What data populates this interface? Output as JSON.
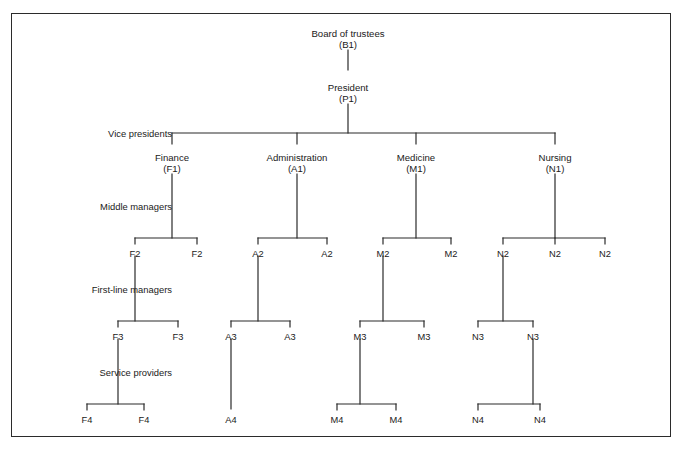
{
  "figure": {
    "kind": "organizational-chart",
    "border_color": "#2b2b2b",
    "line_color": "#2b2b2b",
    "text_color": "#1a1a1a",
    "background": "#ffffff"
  },
  "tier_labels": [
    {
      "id": "vice-presidents",
      "text": "Vice presidents",
      "x": 172,
      "y": 133
    },
    {
      "id": "middle-managers",
      "text": "Middle managers",
      "x": 172,
      "y": 206
    },
    {
      "id": "first-line-managers",
      "text": "First-line managers",
      "x": 172,
      "y": 289
    },
    {
      "id": "service-providers",
      "text": "Service providers",
      "x": 172,
      "y": 372
    }
  ],
  "nodes": [
    {
      "id": "board",
      "title": "Board of trustees",
      "code": "(B1)",
      "x": 348,
      "y": 28
    },
    {
      "id": "president",
      "title": "President",
      "code": "(P1)",
      "x": 348,
      "y": 82
    },
    {
      "id": "vp-finance",
      "title": "Finance",
      "code": "(F1)",
      "x": 172,
      "y": 152
    },
    {
      "id": "vp-administration",
      "title": "Administration",
      "code": "(A1)",
      "x": 297,
      "y": 152
    },
    {
      "id": "vp-medicine",
      "title": "Medicine",
      "code": "(M1)",
      "x": 416,
      "y": 152
    },
    {
      "id": "vp-nursing",
      "title": "Nursing",
      "code": "(N1)",
      "x": 555,
      "y": 152
    },
    {
      "id": "f2-a",
      "title": "",
      "code": "F2",
      "x": 135,
      "y": 249
    },
    {
      "id": "f2-b",
      "title": "",
      "code": "F2",
      "x": 197,
      "y": 249
    },
    {
      "id": "a2-a",
      "title": "",
      "code": "A2",
      "x": 258,
      "y": 249
    },
    {
      "id": "a2-b",
      "title": "",
      "code": "A2",
      "x": 327,
      "y": 249
    },
    {
      "id": "m2-a",
      "title": "",
      "code": "M2",
      "x": 383,
      "y": 249
    },
    {
      "id": "m2-b",
      "title": "",
      "code": "M2",
      "x": 451,
      "y": 249
    },
    {
      "id": "n2-a",
      "title": "",
      "code": "N2",
      "x": 503,
      "y": 249
    },
    {
      "id": "n2-b",
      "title": "",
      "code": "N2",
      "x": 555,
      "y": 249
    },
    {
      "id": "n2-c",
      "title": "",
      "code": "N2",
      "x": 605,
      "y": 249
    },
    {
      "id": "f3-a",
      "title": "",
      "code": "F3",
      "x": 118,
      "y": 332
    },
    {
      "id": "f3-b",
      "title": "",
      "code": "F3",
      "x": 178,
      "y": 332
    },
    {
      "id": "a3-a",
      "title": "",
      "code": "A3",
      "x": 231,
      "y": 332
    },
    {
      "id": "a3-b",
      "title": "",
      "code": "A3",
      "x": 290,
      "y": 332
    },
    {
      "id": "m3-a",
      "title": "",
      "code": "M3",
      "x": 360,
      "y": 332
    },
    {
      "id": "m3-b",
      "title": "",
      "code": "M3",
      "x": 424,
      "y": 332
    },
    {
      "id": "n3-a",
      "title": "",
      "code": "N3",
      "x": 478,
      "y": 332
    },
    {
      "id": "n3-b",
      "title": "",
      "code": "N3",
      "x": 533,
      "y": 332
    },
    {
      "id": "f4-a",
      "title": "",
      "code": "F4",
      "x": 87,
      "y": 415
    },
    {
      "id": "f4-b",
      "title": "",
      "code": "F4",
      "x": 144,
      "y": 415
    },
    {
      "id": "a4-a",
      "title": "",
      "code": "A4",
      "x": 231,
      "y": 415
    },
    {
      "id": "m4-a",
      "title": "",
      "code": "M4",
      "x": 337,
      "y": 415
    },
    {
      "id": "m4-b",
      "title": "",
      "code": "M4",
      "x": 396,
      "y": 415
    },
    {
      "id": "n4-a",
      "title": "",
      "code": "N4",
      "x": 478,
      "y": 415
    },
    {
      "id": "n4-b",
      "title": "",
      "code": "N4",
      "x": 540,
      "y": 415
    }
  ],
  "connectors": {
    "verticals": [
      {
        "id": "board-to-president",
        "x": 348,
        "y1": 50,
        "y2": 70
      },
      {
        "id": "president-to-bus",
        "x": 348,
        "y1": 104,
        "y2": 133
      },
      {
        "id": "drop-finance",
        "x": 172,
        "y1": 133,
        "y2": 144
      },
      {
        "id": "drop-administration",
        "x": 297,
        "y1": 133,
        "y2": 144
      },
      {
        "id": "drop-medicine",
        "x": 416,
        "y1": 133,
        "y2": 144
      },
      {
        "id": "drop-nursing",
        "x": 555,
        "y1": 133,
        "y2": 144
      },
      {
        "id": "f1-stem",
        "x": 172,
        "y1": 174,
        "y2": 238
      },
      {
        "id": "a1-stem",
        "x": 297,
        "y1": 174,
        "y2": 238
      },
      {
        "id": "m1-stem",
        "x": 416,
        "y1": 174,
        "y2": 238
      },
      {
        "id": "n1-stem",
        "x": 555,
        "y1": 174,
        "y2": 238
      },
      {
        "id": "f2a-tick",
        "x": 135,
        "y1": 238,
        "y2": 244
      },
      {
        "id": "f2b-tick",
        "x": 197,
        "y1": 238,
        "y2": 244
      },
      {
        "id": "a2a-tick",
        "x": 258,
        "y1": 238,
        "y2": 244
      },
      {
        "id": "a2b-tick",
        "x": 327,
        "y1": 238,
        "y2": 244
      },
      {
        "id": "m2a-tick",
        "x": 383,
        "y1": 238,
        "y2": 244
      },
      {
        "id": "m2b-tick",
        "x": 451,
        "y1": 238,
        "y2": 244
      },
      {
        "id": "n2a-tick",
        "x": 503,
        "y1": 238,
        "y2": 244
      },
      {
        "id": "n2b-tick",
        "x": 555,
        "y1": 238,
        "y2": 244
      },
      {
        "id": "n2c-tick",
        "x": 605,
        "y1": 238,
        "y2": 244
      },
      {
        "id": "f2a-stem",
        "x": 135,
        "y1": 256,
        "y2": 321
      },
      {
        "id": "a2a-stem",
        "x": 258,
        "y1": 256,
        "y2": 321
      },
      {
        "id": "m2a-stem",
        "x": 383,
        "y1": 256,
        "y2": 321
      },
      {
        "id": "n2a-stem",
        "x": 503,
        "y1": 256,
        "y2": 321
      },
      {
        "id": "f3a-tick",
        "x": 118,
        "y1": 321,
        "y2": 327
      },
      {
        "id": "f3b-tick",
        "x": 178,
        "y1": 321,
        "y2": 327
      },
      {
        "id": "a3a-tick",
        "x": 231,
        "y1": 321,
        "y2": 327
      },
      {
        "id": "a3b-tick",
        "x": 290,
        "y1": 321,
        "y2": 327
      },
      {
        "id": "m3a-tick",
        "x": 360,
        "y1": 321,
        "y2": 327
      },
      {
        "id": "m3b-tick",
        "x": 424,
        "y1": 321,
        "y2": 327
      },
      {
        "id": "n3a-tick",
        "x": 478,
        "y1": 321,
        "y2": 327
      },
      {
        "id": "n3b-tick",
        "x": 533,
        "y1": 321,
        "y2": 327
      },
      {
        "id": "f3a-stem",
        "x": 118,
        "y1": 339,
        "y2": 404
      },
      {
        "id": "a3a-stem",
        "x": 231,
        "y1": 339,
        "y2": 409
      },
      {
        "id": "m3a-stem",
        "x": 360,
        "y1": 339,
        "y2": 404
      },
      {
        "id": "n3b-stem",
        "x": 533,
        "y1": 339,
        "y2": 404
      },
      {
        "id": "f4a-tick",
        "x": 87,
        "y1": 404,
        "y2": 410
      },
      {
        "id": "f4b-tick",
        "x": 144,
        "y1": 404,
        "y2": 410
      },
      {
        "id": "m4a-tick",
        "x": 337,
        "y1": 404,
        "y2": 410
      },
      {
        "id": "m4b-tick",
        "x": 396,
        "y1": 404,
        "y2": 410
      },
      {
        "id": "n4a-tick",
        "x": 478,
        "y1": 404,
        "y2": 410
      },
      {
        "id": "n4b-tick",
        "x": 540,
        "y1": 404,
        "y2": 410
      }
    ],
    "horizontals": [
      {
        "id": "vp-bus",
        "y": 133,
        "x1": 172,
        "x2": 555
      },
      {
        "id": "f2-bus",
        "y": 238,
        "x1": 135,
        "x2": 197
      },
      {
        "id": "a2-bus",
        "y": 238,
        "x1": 258,
        "x2": 327
      },
      {
        "id": "m2-bus",
        "y": 238,
        "x1": 383,
        "x2": 451
      },
      {
        "id": "n2-bus",
        "y": 238,
        "x1": 503,
        "x2": 605
      },
      {
        "id": "f3-bus",
        "y": 321,
        "x1": 118,
        "x2": 178
      },
      {
        "id": "a3-bus",
        "y": 321,
        "x1": 231,
        "x2": 290
      },
      {
        "id": "m3-bus",
        "y": 321,
        "x1": 360,
        "x2": 424
      },
      {
        "id": "n3-bus",
        "y": 321,
        "x1": 478,
        "x2": 533
      },
      {
        "id": "f4-bus",
        "y": 404,
        "x1": 87,
        "x2": 144
      },
      {
        "id": "m4-bus",
        "y": 404,
        "x1": 337,
        "x2": 396
      },
      {
        "id": "n4-bus",
        "y": 404,
        "x1": 478,
        "x2": 540
      }
    ]
  }
}
